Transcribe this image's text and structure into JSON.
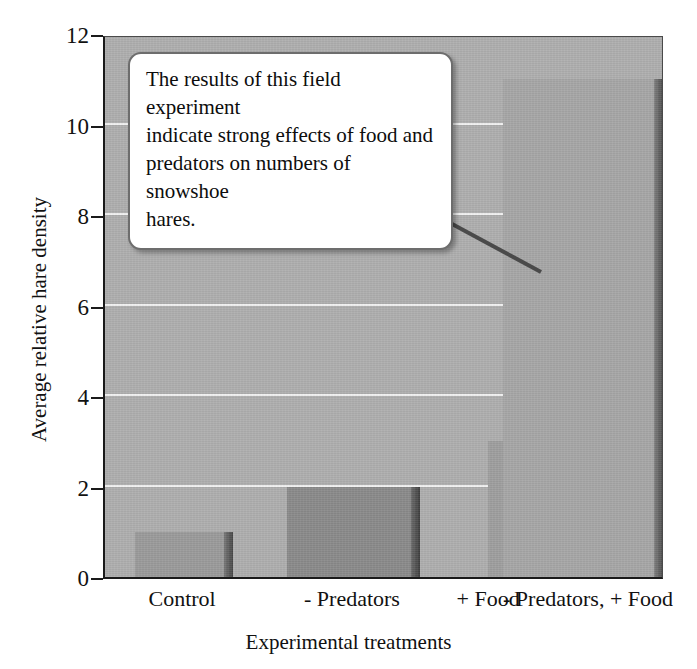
{
  "chart_data": {
    "type": "bar",
    "title": "",
    "categories": [
      "Control",
      "- Predators",
      "+ Food",
      "- Predators, + Food"
    ],
    "values": [
      1,
      2,
      3,
      11
    ],
    "xlabel": "Experimental treatments",
    "ylabel": "Average relative hare density",
    "ylim": [
      0,
      12
    ],
    "yticks": [
      0,
      2,
      4,
      6,
      8,
      10,
      12
    ],
    "ytick_labels": [
      "0",
      "2",
      "4",
      "6",
      "8",
      "10",
      "12"
    ],
    "grid": true,
    "legend": "none",
    "bar_colors": [
      "#9a9a9a",
      "#8a8a8a",
      "#9e9e9e",
      "#a6a6a6"
    ],
    "plot_background": "#aeaeae",
    "gridline_color": "#f2f2f2",
    "axis_color": "#1a1a1a",
    "annotations": [
      {
        "name": "callout",
        "text": "The results of this field experiment indicate strong effects of food and predators on numbers of snowshoe hares.",
        "points_to": "- Predators, + Food"
      }
    ]
  },
  "callout": {
    "line1": "The results of this field experiment",
    "line2": "indicate strong effects of food and",
    "line3": "predators on numbers of snowshoe",
    "line4": "hares."
  }
}
